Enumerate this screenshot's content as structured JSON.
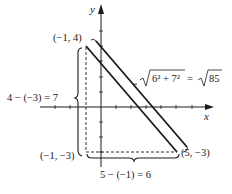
{
  "diagram": {
    "axes": {
      "x_label": "x",
      "y_label": "y"
    },
    "points": [
      {
        "name": "top-left",
        "label": "(−1, 4)",
        "x": -1,
        "y": 4
      },
      {
        "name": "bottom-left",
        "label": "(−1, −3)",
        "x": -1,
        "y": -3
      },
      {
        "name": "bottom-right",
        "label": "(5, −3)",
        "x": 5,
        "y": -3
      }
    ],
    "annotations": {
      "vertical_distance": "4 − (−3) = 7",
      "horizontal_distance": "5 − (−1) = 6",
      "hypotenuse_lhs_prefix": "√",
      "hypotenuse_radicand": "6² + 7²",
      "hypotenuse_equals": " = ",
      "hypotenuse_rhs_prefix": "√",
      "hypotenuse_rhs_radicand": "85"
    },
    "colors": {
      "ink": "#1a1a1a",
      "background": "#ffffff"
    }
  }
}
